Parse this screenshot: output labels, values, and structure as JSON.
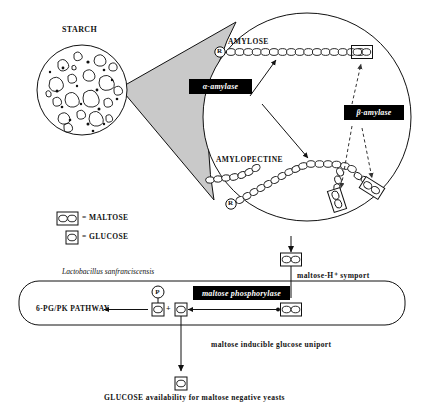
{
  "figure": {
    "title_text": "STARCH",
    "background_color": "#ffffff",
    "ink_color": "#111111",
    "cone_fill": "#c9c9c9"
  },
  "granule": {
    "label": "STARCH",
    "reducing_end_label": "R"
  },
  "magnified": {
    "amylose_label": "AMYLOSE",
    "amylopectin_label": "AMYLOPECTINE",
    "reducing_end_amylose": "R",
    "reducing_end_amylopectin": "R",
    "enzymes": [
      {
        "name": "alpha-amylase",
        "label": "α-amylase",
        "action": "endo",
        "line_style": "solid"
      },
      {
        "name": "beta-amylase",
        "label": "β-amylase",
        "action": "exo",
        "line_style": "dashed"
      }
    ]
  },
  "legend": {
    "items": [
      {
        "symbol": "maltose-symbol",
        "equals": "=",
        "label": "MALTOSE",
        "units": 2
      },
      {
        "symbol": "glucose-symbol",
        "equals": "=",
        "label": "GLUCOSE",
        "units": 1
      }
    ]
  },
  "transport": {
    "symport_label": "maltose-H⁺ symport",
    "uniport_label": "maltose inducible glucose uniport"
  },
  "cell": {
    "organism": "Lactobacillus sanfranciscensis",
    "enzyme_label": "maltose phosphorylase",
    "pathway_label": "6-PG/PK PATHWAY",
    "phosphate_label": "P",
    "plus_label": "+"
  },
  "outcome": {
    "label": "GLUCOSE availability for maltose negative yeasts"
  }
}
